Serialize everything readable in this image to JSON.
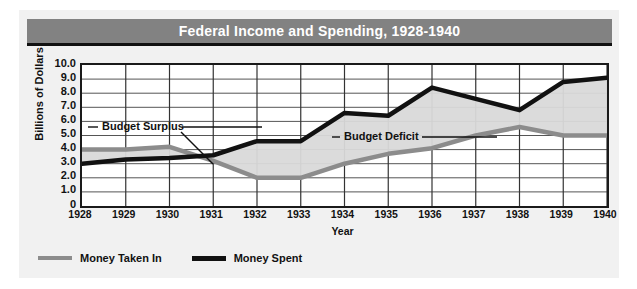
{
  "chart_data": {
    "type": "line",
    "title": "Federal Income and Spending, 1928-1940",
    "xlabel": "Year",
    "ylabel": "Billions of Dollars",
    "categories": [
      "1928",
      "1929",
      "1930",
      "1931",
      "1932",
      "1933",
      "1934",
      "1935",
      "1936",
      "1937",
      "1938",
      "1939",
      "1940"
    ],
    "x": [
      1928,
      1929,
      1930,
      1931,
      1932,
      1933,
      1934,
      1935,
      1936,
      1937,
      1938,
      1939,
      1940
    ],
    "xlim": [
      1928,
      1940
    ],
    "ylim": [
      0,
      10
    ],
    "ytick_labels": [
      "10.0",
      "9.0",
      "8.0",
      "7.0",
      "6.0",
      "5.0",
      "4.0",
      "3.0",
      "2.0",
      "1.0",
      "0"
    ],
    "ytick_values": [
      10,
      9,
      8,
      7,
      6,
      5,
      4,
      3,
      2,
      1,
      0
    ],
    "grid": true,
    "legend_position": "bottom-left",
    "series": [
      {
        "name": "Money Taken In",
        "color": "#8c8c8c",
        "values": [
          4.0,
          4.0,
          4.2,
          3.2,
          2.0,
          2.0,
          3.0,
          3.7,
          4.1,
          5.0,
          5.6,
          5.0,
          5.0
        ]
      },
      {
        "name": "Money Spent",
        "color": "#111111",
        "values": [
          3.0,
          3.3,
          3.4,
          3.6,
          4.6,
          4.6,
          6.6,
          6.4,
          8.4,
          7.6,
          6.8,
          8.8,
          9.1
        ]
      }
    ],
    "fill_between": {
      "label": "area between Money Taken In and Money Spent",
      "color": "#d9d9d9"
    },
    "annotations": [
      {
        "text": "Budget Surplus",
        "near_x": 1929,
        "near_y": 6.0
      },
      {
        "text": "Budget Deficit",
        "near_x": 1935,
        "near_y": 5.3
      }
    ]
  },
  "title_bar": {
    "title": "Federal Income and Spending, 1928-1940",
    "background": "#828282",
    "text_color": "#ffffff"
  },
  "axes": {
    "ylabel": "Billions of Dollars",
    "xlabel": "Year",
    "yticks": [
      "10.0",
      "9.0",
      "8.0",
      "7.0",
      "6.0",
      "5.0",
      "4.0",
      "3.0",
      "2.0",
      "1.0",
      "0"
    ],
    "xticks": [
      "1928",
      "1929",
      "1930",
      "1931",
      "1932",
      "1933",
      "1934",
      "1935",
      "1936",
      "1937",
      "1938",
      "1939",
      "1940"
    ]
  },
  "annotations": {
    "surplus": "Budget Surplus",
    "deficit": "Budget Deficit"
  },
  "legend": {
    "items": [
      {
        "label": "Money Taken In",
        "color": "#8c8c8c"
      },
      {
        "label": "Money Spent",
        "color": "#111111"
      }
    ]
  }
}
